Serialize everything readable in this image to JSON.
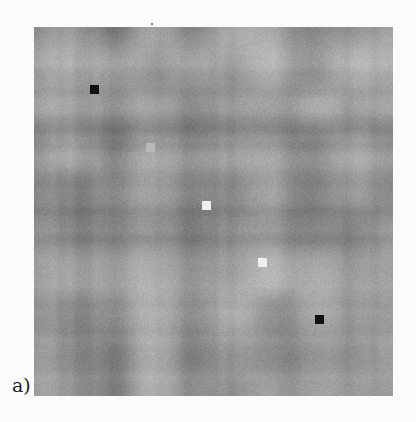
{
  "figure": {
    "panel_label": "a)",
    "image": {
      "description": "grayscale noise-like matrix with marker squares along the main diagonal",
      "left": 34,
      "top": 27,
      "width": 359,
      "height": 369,
      "base_gray": 150,
      "gray_range": [
        110,
        190
      ],
      "seed": 7
    },
    "markers": [
      {
        "name": "marker-1",
        "x": 56,
        "y": 58,
        "size": 9,
        "color": "#111111"
      },
      {
        "name": "marker-2",
        "x": 112,
        "y": 116,
        "size": 9,
        "color": "#b9b9b9"
      },
      {
        "name": "marker-3",
        "x": 168,
        "y": 174,
        "size": 9,
        "color": "#eeeeee"
      },
      {
        "name": "marker-4",
        "x": 224,
        "y": 231,
        "size": 9,
        "color": "#eeeeee"
      },
      {
        "name": "marker-5",
        "x": 281,
        "y": 288,
        "size": 9,
        "color": "#121212"
      }
    ]
  }
}
